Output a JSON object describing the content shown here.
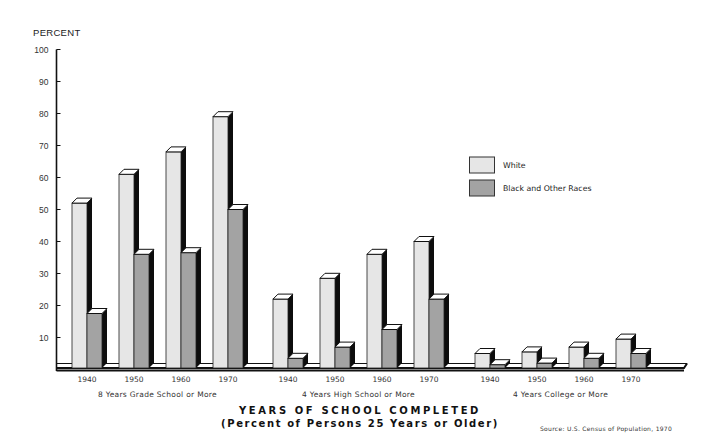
{
  "chart_data": {
    "type": "bar",
    "title": "YEARS OF SCHOOL COMPLETED",
    "subtitle": "(Percent of Persons 25 Years or Older)",
    "ylabel": "PERCENT",
    "xlabel": "",
    "ylim": [
      0,
      100
    ],
    "yticks": [
      10,
      20,
      30,
      40,
      50,
      60,
      70,
      80,
      90,
      100
    ],
    "grid": false,
    "legend_position": "right",
    "source": "Source:  U.S. Census of Population, 1970",
    "groups": [
      {
        "label": "8 Years Grade School or More",
        "categories": [
          "1940",
          "1950",
          "1960",
          "1970"
        ],
        "series": [
          {
            "name": "White",
            "values": [
              52,
              61,
              68,
              79
            ]
          },
          {
            "name": "Black and Other Races",
            "values": [
              17.5,
              36,
              36.5,
              50
            ]
          }
        ]
      },
      {
        "label": "4 Years High School or More",
        "categories": [
          "1940",
          "1950",
          "1960",
          "1970"
        ],
        "series": [
          {
            "name": "White",
            "values": [
              22,
              28.5,
              36,
              40
            ]
          },
          {
            "name": "Black and Other Races",
            "values": [
              3.5,
              7,
              12.5,
              22
            ]
          }
        ]
      },
      {
        "label": "4 Years College or More",
        "categories": [
          "1940",
          "1950",
          "1960",
          "1970"
        ],
        "series": [
          {
            "name": "White",
            "values": [
              5,
              5.5,
              7,
              9.5
            ]
          },
          {
            "name": "Black and Other Races",
            "values": [
              1.5,
              2,
              3.5,
              5
            ]
          }
        ]
      }
    ],
    "legend": [
      {
        "name": "White",
        "color": "#e6e6e6"
      },
      {
        "name": "Black and Other Races",
        "color": "#a3a3a3"
      }
    ]
  },
  "colors": {
    "white_series": "#e6e6e6",
    "black_series": "#a3a3a3",
    "shadow": "#0d0d0d",
    "axis": "#111111"
  },
  "layout_hint": {
    "group_first_bar_x": [
      72,
      273,
      475
    ],
    "bar_step": 47
  }
}
